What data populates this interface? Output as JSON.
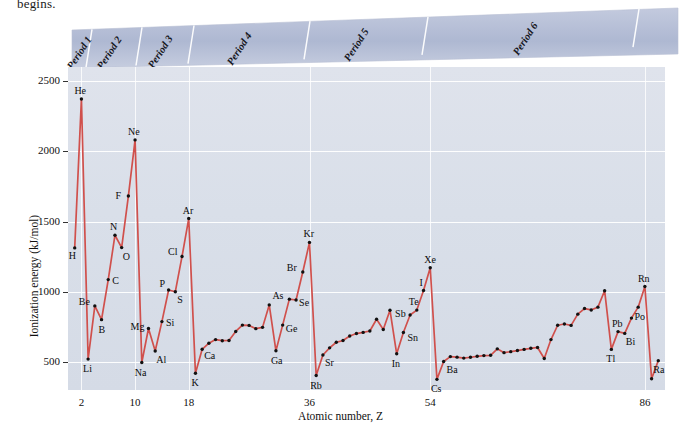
{
  "page": {
    "cut_text": "begins."
  },
  "banner": {
    "periods": [
      {
        "label": "Period 1"
      },
      {
        "label": "Period 2"
      },
      {
        "label": "Period 3"
      },
      {
        "label": "Period 4"
      },
      {
        "label": "Period 5"
      },
      {
        "label": "Period 6"
      }
    ]
  },
  "chart_data": {
    "type": "line",
    "title": "",
    "xlabel": "Atomic number, Z",
    "ylabel": "Ionization energy (kJ/mol)",
    "xlim": [
      0,
      89
    ],
    "ylim": [
      300,
      2600
    ],
    "grid": true,
    "legend": "none",
    "line_color": "#d0504c",
    "marker_color": "#111111",
    "plot_background": "#dce0ea",
    "xticks": [
      2,
      10,
      18,
      36,
      54,
      86
    ],
    "yticks": [
      500,
      1000,
      1500,
      2000,
      2500
    ],
    "x": [
      1,
      2,
      3,
      4,
      5,
      6,
      7,
      8,
      9,
      10,
      11,
      12,
      13,
      14,
      15,
      16,
      17,
      18,
      19,
      20,
      21,
      22,
      23,
      24,
      25,
      26,
      27,
      28,
      29,
      30,
      31,
      32,
      33,
      34,
      35,
      36,
      37,
      38,
      39,
      40,
      41,
      42,
      43,
      44,
      45,
      46,
      47,
      48,
      49,
      50,
      51,
      52,
      53,
      54,
      55,
      56,
      57,
      58,
      59,
      60,
      61,
      62,
      63,
      64,
      65,
      66,
      67,
      68,
      69,
      70,
      71,
      72,
      73,
      74,
      75,
      76,
      77,
      78,
      79,
      80,
      81,
      82,
      83,
      84,
      85,
      86,
      87,
      88
    ],
    "values": [
      1312,
      2372,
      520,
      899,
      801,
      1086,
      1402,
      1314,
      1681,
      2081,
      496,
      738,
      578,
      787,
      1012,
      1000,
      1251,
      1521,
      419,
      590,
      633,
      659,
      651,
      653,
      717,
      762,
      760,
      737,
      746,
      906,
      579,
      762,
      947,
      941,
      1140,
      1351,
      403,
      549,
      600,
      640,
      652,
      684,
      702,
      710,
      720,
      804,
      731,
      868,
      558,
      709,
      834,
      869,
      1008,
      1170,
      376,
      503,
      538,
      534,
      527,
      533,
      540,
      545,
      547,
      593,
      566,
      573,
      581,
      589,
      597,
      603,
      524,
      659,
      761,
      770,
      760,
      840,
      880,
      870,
      890,
      1007,
      589,
      716,
      703,
      812,
      890,
      1037,
      380,
      509
    ],
    "element_labels": [
      {
        "symbol": "H",
        "z": 1,
        "ie": 1312,
        "dx": -6,
        "dy": 11
      },
      {
        "symbol": "He",
        "z": 2,
        "ie": 2372,
        "dx": -7,
        "dy": -5
      },
      {
        "symbol": "Li",
        "z": 3,
        "ie": 520,
        "dx": -5,
        "dy": 13
      },
      {
        "symbol": "Be",
        "z": 4,
        "ie": 899,
        "dx": -16,
        "dy": -1
      },
      {
        "symbol": "B",
        "z": 5,
        "ie": 801,
        "dx": -3,
        "dy": 13
      },
      {
        "symbol": "C",
        "z": 6,
        "ie": 1086,
        "dx": 4,
        "dy": 4
      },
      {
        "symbol": "N",
        "z": 7,
        "ie": 1402,
        "dx": -5,
        "dy": -5
      },
      {
        "symbol": "O",
        "z": 8,
        "ie": 1314,
        "dx": 1,
        "dy": 12
      },
      {
        "symbol": "F",
        "z": 9,
        "ie": 1681,
        "dx": -13,
        "dy": 3
      },
      {
        "symbol": "Ne",
        "z": 10,
        "ie": 2081,
        "dx": -7,
        "dy": -5
      },
      {
        "symbol": "Na",
        "z": 11,
        "ie": 496,
        "dx": -7,
        "dy": 13
      },
      {
        "symbol": "Mg",
        "z": 12,
        "ie": 738,
        "dx": -18,
        "dy": 1
      },
      {
        "symbol": "Al",
        "z": 13,
        "ie": 578,
        "dx": 1,
        "dy": 12
      },
      {
        "symbol": "Si",
        "z": 14,
        "ie": 787,
        "dx": 4,
        "dy": 4
      },
      {
        "symbol": "P",
        "z": 15,
        "ie": 1012,
        "dx": -9,
        "dy": -3
      },
      {
        "symbol": "S",
        "z": 16,
        "ie": 1000,
        "dx": 2,
        "dy": 11
      },
      {
        "symbol": "Cl",
        "z": 17,
        "ie": 1251,
        "dx": -14,
        "dy": -1
      },
      {
        "symbol": "Ar",
        "z": 18,
        "ie": 1521,
        "dx": -6,
        "dy": -5
      },
      {
        "symbol": "K",
        "z": 19,
        "ie": 419,
        "dx": -4,
        "dy": 13
      },
      {
        "symbol": "Ca",
        "z": 20,
        "ie": 590,
        "dx": 2,
        "dy": 10
      },
      {
        "symbol": "Ga",
        "z": 31,
        "ie": 579,
        "dx": -5,
        "dy": 13
      },
      {
        "symbol": "Ge",
        "z": 32,
        "ie": 762,
        "dx": 3,
        "dy": 7
      },
      {
        "symbol": "As",
        "z": 33,
        "ie": 947,
        "dx": -17,
        "dy": 0
      },
      {
        "symbol": "Se",
        "z": 34,
        "ie": 941,
        "dx": 3,
        "dy": 6
      },
      {
        "symbol": "Br",
        "z": 35,
        "ie": 1140,
        "dx": -16,
        "dy": -1
      },
      {
        "symbol": "Kr",
        "z": 36,
        "ie": 1351,
        "dx": -6,
        "dy": -5
      },
      {
        "symbol": "Rb",
        "z": 37,
        "ie": 403,
        "dx": -6,
        "dy": 13
      },
      {
        "symbol": "Sr",
        "z": 38,
        "ie": 549,
        "dx": 2,
        "dy": 11
      },
      {
        "symbol": "In",
        "z": 49,
        "ie": 558,
        "dx": -5,
        "dy": 13
      },
      {
        "symbol": "Sn",
        "z": 50,
        "ie": 709,
        "dx": 4,
        "dy": 8
      },
      {
        "symbol": "Sb",
        "z": 51,
        "ie": 834,
        "dx": -15,
        "dy": 2
      },
      {
        "symbol": "Te",
        "z": 52,
        "ie": 869,
        "dx": -8,
        "dy": -5
      },
      {
        "symbol": "I",
        "z": 53,
        "ie": 1008,
        "dx": -4,
        "dy": -5
      },
      {
        "symbol": "Xe",
        "z": 54,
        "ie": 1170,
        "dx": -6,
        "dy": -5
      },
      {
        "symbol": "Cs",
        "z": 55,
        "ie": 376,
        "dx": -6,
        "dy": 13
      },
      {
        "symbol": "Ba",
        "z": 56,
        "ie": 503,
        "dx": 3,
        "dy": 11
      },
      {
        "symbol": "Tl",
        "z": 81,
        "ie": 589,
        "dx": -5,
        "dy": 13
      },
      {
        "symbol": "Pb",
        "z": 82,
        "ie": 716,
        "dx": -6,
        "dy": -5
      },
      {
        "symbol": "Bi",
        "z": 83,
        "ie": 703,
        "dx": 1,
        "dy": 12
      },
      {
        "symbol": "Po",
        "z": 84,
        "ie": 812,
        "dx": 3,
        "dy": 2
      },
      {
        "symbol": "Rn",
        "z": 86,
        "ie": 1037,
        "dx": -7,
        "dy": -5
      },
      {
        "symbol": "Ra",
        "z": 88,
        "ie": 509,
        "dx": -5,
        "dy": 12
      }
    ]
  }
}
